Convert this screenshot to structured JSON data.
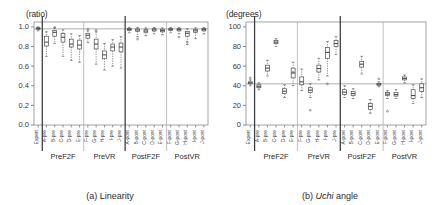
{
  "figure": {
    "panels": [
      {
        "id": "panel-a",
        "caption_prefix": "(a)",
        "caption_text": "Linearity",
        "caption_italic": "",
        "unit_label": "(ratio)"
      },
      {
        "id": "panel-b",
        "caption_prefix": "(b)",
        "caption_text": "angle",
        "caption_italic": "Uchi",
        "unit_label": "(degrees)"
      }
    ]
  },
  "chart_data": [
    {
      "type": "box",
      "panel": "a",
      "title": "(a) Linearity",
      "xlabel": "",
      "ylabel": "(ratio)",
      "ylim": [
        0.0,
        1.05
      ],
      "yticks": [
        0.0,
        0.2,
        0.4,
        0.6,
        0.8,
        1.0
      ],
      "ytick_labels": [
        "0.0",
        "0.2",
        "0.4",
        "0.6",
        "0.8",
        "1.0"
      ],
      "grid": false,
      "reference_line": 0.98,
      "legend": "none",
      "group_labels": [
        "PreF2F",
        "PreVR",
        "PostF2F",
        "PostVR"
      ],
      "group_spans": [
        [
          1,
          5
        ],
        [
          6,
          10
        ],
        [
          11,
          15
        ],
        [
          16,
          20
        ]
      ],
      "categories": [
        "Expert",
        "A-pre",
        "B-pre",
        "C-pre",
        "D-pre",
        "E-pre",
        "F-pre",
        "G-pre",
        "H-pre",
        "I-pre",
        "J-pre",
        "A-post",
        "B-post",
        "C-post",
        "D-post",
        "E-post",
        "F-post",
        "G-post",
        "H-post",
        "I-post",
        "J-post"
      ],
      "boxes": [
        {
          "label": "Expert",
          "min": 0.96,
          "q1": 0.975,
          "median": 0.985,
          "q3": 0.992,
          "max": 1.0,
          "outliers": []
        },
        {
          "label": "A-pre",
          "min": 0.7,
          "q1": 0.805,
          "median": 0.845,
          "median2": 0.86,
          "q3": 0.905,
          "max": 0.95,
          "outliers": []
        },
        {
          "label": "B-pre",
          "min": 0.83,
          "q1": 0.905,
          "median": 0.945,
          "q3": 0.965,
          "max": 0.99,
          "outliers": [
            0.995
          ]
        },
        {
          "label": "C-pre",
          "min": 0.7,
          "q1": 0.845,
          "median": 0.895,
          "q3": 0.935,
          "max": 0.97,
          "outliers": []
        },
        {
          "label": "D-pre",
          "min": 0.66,
          "q1": 0.795,
          "median": 0.825,
          "q3": 0.875,
          "max": 0.93,
          "outliers": []
        },
        {
          "label": "E-pre",
          "min": 0.64,
          "q1": 0.775,
          "median": 0.815,
          "q3": 0.865,
          "max": 0.91,
          "outliers": []
        },
        {
          "label": "F-pre",
          "min": 0.84,
          "q1": 0.885,
          "median": 0.915,
          "q3": 0.935,
          "max": 0.96,
          "outliers": [
            0.975
          ]
        },
        {
          "label": "G-pre",
          "min": 0.62,
          "q1": 0.775,
          "median": 0.825,
          "q3": 0.875,
          "max": 0.95,
          "outliers": [
            0.965
          ]
        },
        {
          "label": "H-pre",
          "min": 0.56,
          "q1": 0.675,
          "median": 0.715,
          "q3": 0.755,
          "max": 0.83,
          "outliers": []
        },
        {
          "label": "I-pre",
          "min": 0.6,
          "q1": 0.755,
          "median": 0.795,
          "q3": 0.825,
          "max": 0.87,
          "outliers": []
        },
        {
          "label": "J-pre",
          "min": 0.58,
          "q1": 0.745,
          "median": 0.795,
          "q3": 0.835,
          "max": 0.9,
          "outliers": []
        },
        {
          "label": "A-post",
          "min": 0.94,
          "q1": 0.965,
          "median": 0.975,
          "q3": 0.985,
          "max": 0.995,
          "outliers": []
        },
        {
          "label": "B-post",
          "min": 0.9,
          "q1": 0.955,
          "median": 0.968,
          "q3": 0.98,
          "max": 0.995,
          "outliers": [
            0.875
          ]
        },
        {
          "label": "C-post",
          "min": 0.91,
          "q1": 0.945,
          "median": 0.958,
          "q3": 0.972,
          "max": 0.99,
          "outliers": []
        },
        {
          "label": "D-post",
          "min": 0.93,
          "q1": 0.958,
          "median": 0.97,
          "q3": 0.982,
          "max": 0.995,
          "outliers": []
        },
        {
          "label": "E-post",
          "min": 0.92,
          "q1": 0.95,
          "median": 0.962,
          "q3": 0.976,
          "max": 0.99,
          "outliers": []
        },
        {
          "label": "F-post",
          "min": 0.94,
          "q1": 0.965,
          "median": 0.975,
          "q3": 0.985,
          "max": 0.995,
          "outliers": []
        },
        {
          "label": "G-post",
          "min": 0.93,
          "q1": 0.96,
          "median": 0.972,
          "q3": 0.982,
          "max": 0.995,
          "outliers": [
            0.895
          ]
        },
        {
          "label": "H-post",
          "min": 0.82,
          "q1": 0.905,
          "median": 0.935,
          "q3": 0.955,
          "max": 0.98,
          "outliers": [
            0.845
          ]
        },
        {
          "label": "I-post",
          "min": 0.88,
          "q1": 0.945,
          "median": 0.96,
          "q3": 0.975,
          "max": 0.99,
          "outliers": []
        },
        {
          "label": "J-post",
          "min": 0.93,
          "q1": 0.96,
          "median": 0.972,
          "q3": 0.985,
          "max": 0.995,
          "outliers": []
        }
      ]
    },
    {
      "type": "box",
      "panel": "b",
      "title": "(b) Uchi angle",
      "xlabel": "",
      "ylabel": "(degrees)",
      "ylim": [
        0,
        105
      ],
      "yticks": [
        0,
        20,
        40,
        60,
        80,
        100
      ],
      "ytick_labels": [
        "0",
        "20",
        "40",
        "60",
        "80",
        "100"
      ],
      "grid": false,
      "reference_line": 42,
      "legend": "none",
      "group_labels": [
        "PreF2F",
        "PreVR",
        "PostF2F",
        "PostVR"
      ],
      "group_spans": [
        [
          1,
          5
        ],
        [
          6,
          10
        ],
        [
          11,
          15
        ],
        [
          16,
          20
        ]
      ],
      "categories": [
        "Expert",
        "A-pre",
        "B-pre",
        "C-pre",
        "D-pre",
        "E-pre",
        "F-pre",
        "G-pre",
        "H-pre",
        "I-pre",
        "J-pre",
        "A-post",
        "B-post",
        "C-post",
        "D-post",
        "E-post",
        "F-post",
        "G-post",
        "H-post",
        "I-post",
        "J-post"
      ],
      "boxes": [
        {
          "label": "Expert",
          "min": 40,
          "q1": 42,
          "median": 43,
          "q3": 44,
          "max": 46,
          "outliers": [
            48
          ]
        },
        {
          "label": "A-pre",
          "min": 36,
          "q1": 38,
          "median": 39.5,
          "q3": 41,
          "max": 43,
          "outliers": []
        },
        {
          "label": "B-pre",
          "min": 50,
          "q1": 55,
          "median": 58,
          "q3": 61,
          "max": 66,
          "outliers": []
        },
        {
          "label": "C-pre",
          "min": 80,
          "q1": 83,
          "median": 84.5,
          "q3": 86,
          "max": 88,
          "outliers": []
        },
        {
          "label": "D-pre",
          "min": 28,
          "q1": 32,
          "median": 34.5,
          "q3": 37,
          "max": 41,
          "outliers": []
        },
        {
          "label": "E-pre",
          "min": 40,
          "q1": 48,
          "median": 53,
          "q3": 58,
          "max": 64,
          "outliers": [
            54
          ]
        },
        {
          "label": "F-pre",
          "min": 35,
          "q1": 41,
          "median": 44,
          "q3": 49,
          "max": 57,
          "outliers": []
        },
        {
          "label": "G-pre",
          "min": 28,
          "q1": 33,
          "median": 35.5,
          "q3": 38,
          "max": 42,
          "outliers": [
            15
          ]
        },
        {
          "label": "H-pre",
          "min": 46,
          "q1": 54,
          "median": 57.5,
          "q3": 61,
          "max": 68,
          "outliers": []
        },
        {
          "label": "I-pre",
          "min": 50,
          "q1": 68,
          "median": 74,
          "q3": 79,
          "max": 85,
          "outliers": [
            42
          ]
        },
        {
          "label": "J-pre",
          "min": 72,
          "q1": 80,
          "median": 83,
          "q3": 86,
          "max": 90,
          "outliers": []
        },
        {
          "label": "A-post",
          "min": 28,
          "q1": 31,
          "median": 33.5,
          "q3": 36,
          "max": 40,
          "outliers": []
        },
        {
          "label": "B-post",
          "min": 27,
          "q1": 30,
          "median": 32,
          "q3": 34,
          "max": 37,
          "outliers": []
        },
        {
          "label": "C-post",
          "min": 52,
          "q1": 59,
          "median": 62,
          "q3": 65,
          "max": 70,
          "outliers": []
        },
        {
          "label": "D-post",
          "min": 12,
          "q1": 16,
          "median": 19,
          "q3": 22,
          "max": 26,
          "outliers": []
        },
        {
          "label": "E-post",
          "min": 39,
          "q1": 40.5,
          "median": 41.5,
          "q3": 42.5,
          "max": 44,
          "outliers": [
            47
          ]
        },
        {
          "label": "F-post",
          "min": 27,
          "q1": 30,
          "median": 31.5,
          "q3": 33,
          "max": 35,
          "outliers": [
            14
          ]
        },
        {
          "label": "G-post",
          "min": 27,
          "q1": 29.5,
          "median": 31,
          "q3": 33,
          "max": 36,
          "outliers": []
        },
        {
          "label": "H-post",
          "min": 43,
          "q1": 46,
          "median": 47.5,
          "q3": 49,
          "max": 51,
          "outliers": []
        },
        {
          "label": "I-post",
          "min": 22,
          "q1": 27,
          "median": 30,
          "q3": 36,
          "max": 41,
          "outliers": []
        },
        {
          "label": "J-post",
          "min": 28,
          "q1": 34,
          "median": 38,
          "q3": 42,
          "max": 47,
          "outliers": []
        }
      ]
    }
  ],
  "style": {
    "line_color": "#4a4a4a",
    "box_fill": "#ffffff",
    "reference_color": "#9a9a9a",
    "separator_color": "#3a3a3a",
    "group_divider_color": "#b0b0b0"
  }
}
